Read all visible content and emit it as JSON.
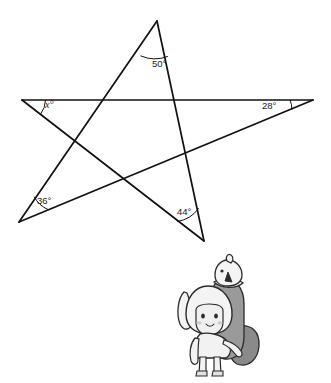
{
  "figure": {
    "type": "geometry-diagram",
    "shape": "five-pointed-star-pentagram",
    "background_color": "#ffffff",
    "line_color": "#111111",
    "canvas": {
      "width": 331,
      "height": 383
    }
  },
  "star": {
    "vertices": [
      {
        "id": "top",
        "name": "top-point",
        "x": 157,
        "y": 21,
        "angle_label": "50°",
        "known": true
      },
      {
        "id": "right",
        "name": "right-point",
        "x": 313,
        "y": 100,
        "angle_label": "28°",
        "known": true
      },
      {
        "id": "bottom_right",
        "name": "bottom-right-point",
        "x": 204,
        "y": 241,
        "angle_label": "44°",
        "known": true
      },
      {
        "id": "bottom_left",
        "name": "bottom-left-point",
        "x": 19,
        "y": 222,
        "angle_label": "36°",
        "known": true
      },
      {
        "id": "left",
        "name": "left-point",
        "x": 22,
        "y": 100,
        "angle_label": "x°",
        "known": false
      }
    ],
    "edges": [
      {
        "from": "top",
        "to": "bottom_left"
      },
      {
        "from": "top",
        "to": "bottom_right"
      },
      {
        "from": "left",
        "to": "right"
      },
      {
        "from": "left",
        "to": "bottom_right"
      },
      {
        "from": "bottom_left",
        "to": "right"
      }
    ]
  },
  "labels": {
    "top_angle": {
      "text": "50°",
      "x": 152,
      "y": 64,
      "italic": false
    },
    "right_angle": {
      "text": "28°",
      "x": 271,
      "y": 106,
      "italic": false
    },
    "bottom_right_angle": {
      "text": "44°",
      "x": 186,
      "y": 212,
      "italic": false
    },
    "bottom_left_angle": {
      "text": "36°",
      "x": 39,
      "y": 202,
      "italic": false
    },
    "left_angle": {
      "text": "x°",
      "x": 47,
      "y": 105,
      "italic": true
    }
  },
  "illustration": {
    "name": "cartoon-child-with-penguin",
    "description": "Grayscale cartoon of a child wearing a bunny hood standing beside a penguin",
    "x": 178,
    "y": 258,
    "width": 90,
    "height": 120,
    "palette": {
      "outline": "#2b2b2b",
      "light": "#f2f2f2",
      "mid": "#b8b8b8",
      "dark": "#8a8a8a",
      "darker": "#6e6e6e"
    }
  }
}
